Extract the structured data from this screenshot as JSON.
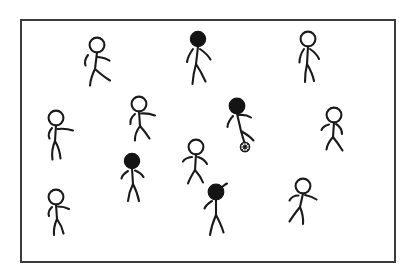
{
  "scene": {
    "title": "Stick figure soccer scene",
    "description": "Thirteen hand-drawn stick figures inside a thin rectangular frame; one dark-headed figure has a soccer ball at their feet.",
    "canvas": {
      "width": 418,
      "height": 279
    },
    "background_color": "#ffffff"
  },
  "frame": {
    "name": "scene-border",
    "x": 21,
    "y": 20,
    "width": 374,
    "height": 242,
    "stroke_color": "#3a3a3a",
    "stroke_width": 2,
    "fill_color": "#ffffff"
  },
  "style": {
    "line_color": "#1a1a1a",
    "line_width": 2.1,
    "open_head_fill": "#ffffff",
    "filled_head_fill": "#141414"
  },
  "counts": {
    "total_figures": 13,
    "open_head_figures": 8,
    "filled_head_figures": 5,
    "balls": 1
  },
  "ball": {
    "label": "soccer-ball",
    "cx": 245,
    "cy": 147,
    "r": 4.6,
    "fill_color": "#ffffff",
    "patch_color": "#141414"
  },
  "figures": [
    {
      "id": "figure-1",
      "label": "open-head walker upper left",
      "head": "open",
      "head_cx": 97,
      "head_cy": 45,
      "head_r": 7.4,
      "pose": "walking-right",
      "torso": "M97,52.5 L95,69",
      "arms": "M88,55 C84.5,59.5 84.5,62.5 85.5,65.5 M97.5,57 C103,57.5 107,58.8 109.5,60.6",
      "legs": "M95,69 C92,75 90.5,80 90,85.5 M95,69 C100,73.5 105,77.5 110,80.5"
    },
    {
      "id": "figure-2",
      "label": "filled-head walker top center",
      "head": "filled",
      "head_cx": 198,
      "head_cy": 39,
      "head_r": 7.6,
      "pose": "walking-forward",
      "torso": "M198,46.5 L196,64",
      "arms": "M193,49 C189,54.5 187.5,58.5 187,62 M200,49 C205,52.5 208.5,56 210.5,59.5",
      "legs": "M196,64 C194,71 193,77.5 192.5,84 M196,64 C200,70 203,76 205.5,81.5"
    },
    {
      "id": "figure-3",
      "label": "open-head standing top right",
      "head": "open",
      "head_cx": 308,
      "head_cy": 39,
      "head_r": 7.4,
      "pose": "standing",
      "torso": "M308,46.5 L307,64",
      "arms": "M304,49 C300.5,54 299.5,58.5 299.5,62.5 M310,49 C314.5,52 317.5,55.5 319,59",
      "legs": "M307,64 C305.5,70.5 305,76 305,82 M307,64 C310.5,70 313,75.5 314,81"
    },
    {
      "id": "figure-4",
      "label": "open-head reaching mid left",
      "head": "open",
      "head_cx": 56,
      "head_cy": 118,
      "head_r": 7.4,
      "pose": "arm-extended-right",
      "torso": "M56,125.5 L55,141",
      "arms": "M52,128 C48.5,132 48,135.5 49.5,138.5 M57.5,129 C63,128.5 68.5,129 73,130.5",
      "legs": "M55,141 C52.5,147 51.5,153 52.5,159.5 M55,141 C58.5,147 60,152.5 60.5,158.5"
    },
    {
      "id": "figure-5",
      "label": "open-head leaning center left",
      "head": "open",
      "head_cx": 139,
      "head_cy": 104,
      "head_r": 7.4,
      "pose": "leaning-arm-out",
      "torso": "M139,111.5 L140,126",
      "arms": "M135,114 C131,117.5 130,121 130.5,124 M141,113.5 C146,113 151,114 155,115.5",
      "legs": "M140,126 C136.5,131 134.5,135.5 135,140.5 M140,126 C144,130.5 147,134.5 149.5,138.5"
    },
    {
      "id": "figure-6",
      "label": "filled-head player with ball",
      "head": "filled",
      "head_cx": 237,
      "head_cy": 106,
      "head_r": 7.8,
      "pose": "dribbling-ball",
      "torso": "M237,113.5 L241,131",
      "arms": "M233,116 C229,120.5 227.5,124 227.5,127 M239,115 C244,114.5 248,115.5 251,117.5",
      "legs": "M241,131 C242.5,136.5 244,141 245,144.5 M241,131 C247,134.5 251,137.5 253.5,140.5"
    },
    {
      "id": "figure-7",
      "label": "open-head runner mid right",
      "head": "open",
      "head_cx": 334,
      "head_cy": 115,
      "head_r": 7.4,
      "pose": "running-left",
      "torso": "M334,122.5 L333,137",
      "arms": "M329,124.5 C325,125.5 322.5,127.5 321.5,130 M336,124 C340,126.5 342,130 342,134",
      "legs": "M333,137 C329.5,141 327,145 326.5,149.5 M333,137 C337,142 340,146.5 342.5,150.5"
    },
    {
      "id": "figure-8",
      "label": "open-head center figure",
      "head": "open",
      "head_cx": 196,
      "head_cy": 147,
      "head_r": 7.4,
      "pose": "arms-spread",
      "torso": "M196,154.5 L195,170",
      "arms": "M192,157 C187.5,157.5 184.5,159 183,161.5 M198,157 C202.5,158.5 205.5,161 207,164",
      "legs": "M195,170 C192,175 189.5,179 188,183.5 M195,170 C199,174.5 201.5,178.5 203,182.5"
    },
    {
      "id": "figure-9",
      "label": "filled-head walker lower left center",
      "head": "filled",
      "head_cx": 132,
      "head_cy": 161,
      "head_r": 7.6,
      "pose": "walking",
      "torso": "M132,168.5 L133,184",
      "arms": "M128,171 C124,173.5 122,176 121.5,178.5 M135,170.5 C139,172 142,174.5 143.5,177",
      "legs": "M133,184 C130,190 128.5,195.5 128,201 M133,184 C136,190 138,195.5 139,201"
    },
    {
      "id": "figure-10",
      "label": "filled-head figure with raised arm",
      "head": "filled",
      "head_cx": 216,
      "head_cy": 192,
      "head_r": 7.8,
      "pose": "arm-raised",
      "torso": "M216,199.5 L216,215",
      "arms": "M212,201 C208,203.5 205.5,206 204.5,208.5 M219,189.5 C222.5,186.5 225,184.5 227,183.5",
      "legs": "M216,215 C213,222 211,228.5 210,235 M216,215 C219.5,221.5 222,227 223.5,232.5"
    },
    {
      "id": "figure-11",
      "label": "open-head figure bottom left",
      "head": "open",
      "head_cx": 56,
      "head_cy": 197,
      "head_r": 7.4,
      "pose": "arm-out-walking",
      "torso": "M56,204.5 L57,219",
      "arms": "M52,207 C48.5,210.5 48,213.5 49,216 M58,206.5 C62.5,206.5 66,207.5 69,209",
      "legs": "M57,219 C54.5,224.5 53.5,229.5 54,235 M57,219 C60.5,224 62.5,228.5 63.5,233.5"
    },
    {
      "id": "figure-12",
      "label": "open-head runner bottom right",
      "head": "open",
      "head_cx": 303,
      "head_cy": 186,
      "head_r": 7.4,
      "pose": "running-lunge",
      "torso": "M303,193.5 L300,207",
      "arms": "M298.5,195.5 C294,195.5 291,197.5 289.5,200.5 M305,195 C309.5,196 313.5,197.5 316.5,199.5",
      "legs": "M300,207 C296,212 292.5,216.5 289.5,221.5 M300,207 C302.5,213 303.5,218.5 303,224"
    },
    {
      "id": "figure-13",
      "label": "open-head small figure far left top",
      "head": "open",
      "head_cx": 0,
      "head_cy": 0,
      "head_r": 0,
      "pose": "not-rendered",
      "torso": "",
      "arms": "",
      "legs": ""
    }
  ]
}
